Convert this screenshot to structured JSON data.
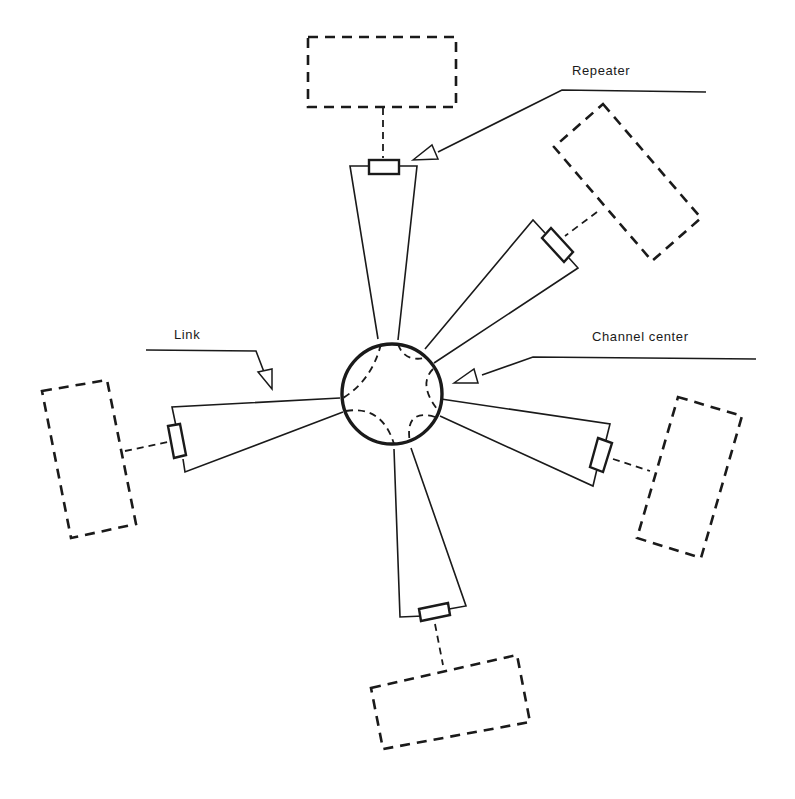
{
  "labels": {
    "repeater": "Repeater",
    "link": "Link",
    "channel_center": "Channel center"
  },
  "diagram": {
    "hub": "Channel center",
    "branches": [
      {
        "name": "top",
        "has_repeater": true,
        "has_station": true
      },
      {
        "name": "upper-right",
        "has_repeater": true,
        "has_station": true
      },
      {
        "name": "right",
        "has_repeater": true,
        "has_station": true
      },
      {
        "name": "bottom",
        "has_repeater": true,
        "has_station": true
      },
      {
        "name": "left",
        "has_repeater": true,
        "has_station": true
      }
    ],
    "colors": {
      "line": "#1a1a1a",
      "background": "#ffffff"
    }
  }
}
